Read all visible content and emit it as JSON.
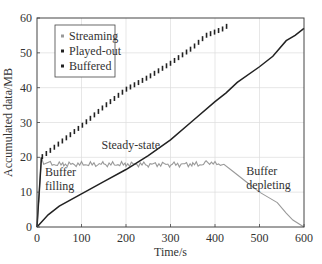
{
  "chart_data": {
    "type": "line",
    "title": "",
    "xlabel": "Time/s",
    "ylabel": "Accumulated data/MB",
    "xlim": [
      0,
      600
    ],
    "ylim": [
      0,
      60
    ],
    "xticks": [
      0,
      100,
      200,
      300,
      400,
      500,
      600
    ],
    "yticks": [
      0,
      10,
      20,
      30,
      40,
      50,
      60
    ],
    "grid": true,
    "legend_position": "upper left",
    "legend": [
      "Streaming",
      "Played-out",
      "Buffered"
    ],
    "annotations": [
      {
        "text": "Steady-state",
        "x": 145,
        "y": 22.5
      },
      {
        "text": "Buffer",
        "x": 18,
        "y": 14.5
      },
      {
        "text": "filling",
        "x": 18,
        "y": 10.5
      },
      {
        "text": "Buffer",
        "x": 470,
        "y": 15
      },
      {
        "text": "depleting",
        "x": 470,
        "y": 11
      }
    ],
    "series": [
      {
        "name": "Streaming",
        "color": "#999999",
        "style": "thin wavy line",
        "x": [
          0,
          5,
          10,
          15,
          30,
          60,
          100,
          150,
          200,
          250,
          300,
          350,
          380,
          400,
          420,
          440,
          460,
          480,
          500,
          520,
          540,
          560,
          575,
          590,
          600
        ],
        "y": [
          0,
          10,
          20,
          18,
          18,
          18,
          18,
          18,
          18,
          18,
          18,
          18,
          18.5,
          18,
          18,
          16,
          14,
          12,
          10,
          8.5,
          7,
          4,
          2,
          0.8,
          0
        ]
      },
      {
        "name": "Played-out",
        "color": "#222222",
        "style": "solid line",
        "x": [
          0,
          25,
          50,
          100,
          150,
          200,
          250,
          300,
          350,
          400,
          425,
          450,
          500,
          530,
          560,
          580,
          600
        ],
        "y": [
          0,
          3.5,
          6,
          9.5,
          13,
          16.5,
          20.5,
          25,
          30.5,
          36,
          38.5,
          41.5,
          46,
          49,
          53.5,
          55,
          57
        ]
      },
      {
        "name": "Buffered",
        "color": "#222222",
        "style": "dashed vertical ticks",
        "x": [
          0,
          10,
          20,
          50,
          100,
          150,
          200,
          250,
          300,
          350,
          380,
          400,
          420,
          430
        ],
        "y": [
          0,
          20,
          21,
          24,
          29,
          34.5,
          39.5,
          43,
          47,
          51.5,
          55,
          56,
          57,
          58
        ]
      }
    ]
  }
}
